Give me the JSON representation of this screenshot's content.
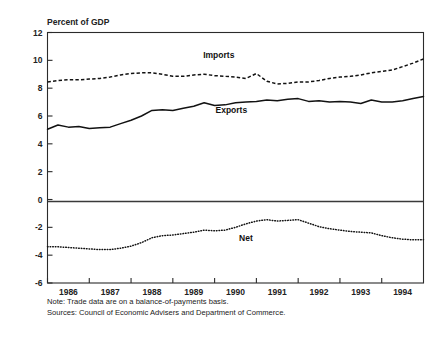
{
  "figure": {
    "y_axis_title": "Percent of GDP",
    "notes": [
      "Note: Trade data are on a balance-of-payments basis.",
      "Sources: Council of Economic Advisers and Department of Commerce."
    ]
  },
  "labels": {
    "imports": "Imports",
    "exports": "Exports",
    "net": "Net"
  },
  "chart_data": {
    "type": "line",
    "title": "",
    "xlabel": "",
    "ylabel": "Percent of GDP",
    "ylim": [
      -6,
      12
    ],
    "xlim": [
      1985.5,
      1994.5
    ],
    "grid": false,
    "legend": "inline-annotations",
    "yticks": [
      12,
      10,
      8,
      6,
      4,
      2,
      0,
      -2,
      -4,
      -6
    ],
    "ytick_labels": [
      "12",
      "10",
      "8",
      "6",
      "4",
      "2",
      "0",
      "-2",
      "-4",
      "-6"
    ],
    "xticks": [
      1986,
      1987,
      1988,
      1989,
      1990,
      1991,
      1992,
      1993,
      1994
    ],
    "xtick_labels": [
      "1986",
      "1987",
      "1988",
      "1989",
      "1990",
      "1991",
      "1992",
      "1993",
      "1994"
    ],
    "annotations": [
      {
        "text": "Imports",
        "x": 1989.6,
        "y": 10.2
      },
      {
        "text": "Exports",
        "x": 1989.9,
        "y": 6.25
      },
      {
        "text": "Net",
        "x": 1990.25,
        "y": -2.95
      }
    ],
    "x": [
      1985.5,
      1985.75,
      1986.0,
      1986.25,
      1986.5,
      1986.75,
      1987.0,
      1987.25,
      1987.5,
      1987.75,
      1988.0,
      1988.25,
      1988.5,
      1988.75,
      1989.0,
      1989.25,
      1989.5,
      1989.75,
      1990.0,
      1990.25,
      1990.5,
      1990.75,
      1991.0,
      1991.25,
      1991.5,
      1991.75,
      1992.0,
      1992.25,
      1992.5,
      1992.75,
      1993.0,
      1993.25,
      1993.5,
      1993.75,
      1994.0,
      1994.25,
      1994.5
    ],
    "series": [
      {
        "name": "Imports",
        "style": "dashed",
        "values": [
          8.45,
          8.55,
          8.6,
          8.6,
          8.65,
          8.7,
          8.8,
          8.95,
          9.05,
          9.1,
          9.1,
          9.0,
          8.85,
          8.85,
          8.95,
          9.0,
          8.9,
          8.85,
          8.8,
          8.7,
          9.05,
          8.5,
          8.3,
          8.35,
          8.45,
          8.45,
          8.55,
          8.7,
          8.8,
          8.85,
          8.95,
          9.1,
          9.2,
          9.3,
          9.55,
          9.8,
          10.1
        ]
      },
      {
        "name": "Exports",
        "style": "solid",
        "values": [
          5.05,
          5.35,
          5.2,
          5.25,
          5.1,
          5.15,
          5.2,
          5.45,
          5.7,
          6.0,
          6.4,
          6.45,
          6.4,
          6.55,
          6.7,
          6.95,
          6.75,
          6.8,
          6.95,
          7.0,
          7.05,
          7.15,
          7.1,
          7.2,
          7.25,
          7.05,
          7.1,
          7.0,
          7.05,
          7.0,
          6.9,
          7.15,
          7.0,
          7.0,
          7.1,
          7.25,
          7.4
        ]
      },
      {
        "name": "Net",
        "style": "dotted",
        "values": [
          -3.4,
          -3.4,
          -3.45,
          -3.5,
          -3.55,
          -3.6,
          -3.6,
          -3.5,
          -3.35,
          -3.1,
          -2.75,
          -2.6,
          -2.55,
          -2.45,
          -2.35,
          -2.2,
          -2.25,
          -2.2,
          -2.0,
          -1.75,
          -1.55,
          -1.45,
          -1.55,
          -1.5,
          -1.45,
          -1.7,
          -1.95,
          -2.1,
          -2.2,
          -2.3,
          -2.35,
          -2.4,
          -2.6,
          -2.75,
          -2.85,
          -2.9,
          -2.9
        ]
      }
    ]
  }
}
